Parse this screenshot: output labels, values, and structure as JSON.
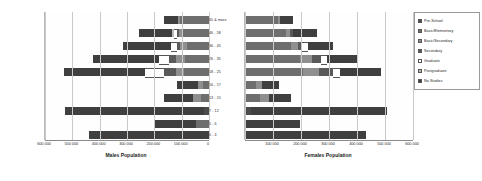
{
  "chart_data": {
    "type": "bar",
    "subtype": "population-pyramid-stacked",
    "title": "",
    "grid": true,
    "legend_position": "right",
    "categories": [
      "65 & more",
      "46 - 58",
      "36 - 45",
      "26 - 35",
      "18 - 25",
      "16 - 17",
      "13 - 15",
      "7 - 12",
      "5 - 6",
      "0 - 4"
    ],
    "series_names": [
      "Pre-School",
      "Basic/Elementary",
      "Basic/Secondary",
      "Secondary",
      "Graduate",
      "Postgraduate",
      "No Studies"
    ],
    "panels": [
      {
        "name": "males",
        "xlabel": "Males Population",
        "direction": "right-to-left",
        "xlim": [
          0,
          600000
        ],
        "ticks": [
          600000,
          500000,
          400000,
          300000,
          200000,
          100000,
          0
        ],
        "tick_labels": [
          "600 000",
          "500 000",
          "400 000",
          "300 000",
          "200 000",
          "100 000",
          "0"
        ],
        "stacks": [
          {
            "category": "65 & more",
            "values": [
              0,
              105000,
              8000,
              0,
              0,
              0,
              52000
            ],
            "total": 165000
          },
          {
            "category": "46 - 58",
            "values": [
              0,
              98000,
              12000,
              9000,
              10000,
              8000,
              118000
            ],
            "total": 255000
          },
          {
            "category": "36 - 45",
            "values": [
              0,
              82000,
              24000,
              12000,
              22000,
              0,
              175000
            ],
            "total": 315000
          },
          {
            "category": "26 - 35",
            "values": [
              0,
              88000,
              34000,
              26000,
              36000,
              0,
              240000
            ],
            "total": 424000
          },
          {
            "category": "18 - 25",
            "values": [
              0,
              92000,
              30000,
              42000,
              70000,
              0,
              296000
            ],
            "total": 530000
          },
          {
            "category": "16 - 17",
            "values": [
              0,
              22000,
              18000,
              0,
              0,
              0,
              78000
            ],
            "total": 118000
          },
          {
            "category": "13 - 15",
            "values": [
              0,
              28000,
              32000,
              0,
              0,
              0,
              104000
            ],
            "total": 164000
          },
          {
            "category": "7 - 12",
            "values": [
              18000,
              0,
              0,
              0,
              0,
              0,
              508000
            ],
            "total": 526000
          },
          {
            "category": "5 - 6",
            "values": [
              0,
              48000,
              0,
              0,
              0,
              0,
              150000
            ],
            "total": 198000
          },
          {
            "category": "0 - 4",
            "values": [
              0,
              0,
              0,
              0,
              0,
              0,
              440000
            ],
            "total": 440000
          }
        ]
      },
      {
        "name": "females",
        "xlabel": "Females Population",
        "direction": "left-to-right",
        "xlim": [
          0,
          600000
        ],
        "ticks": [
          0,
          100000,
          200000,
          300000,
          400000,
          500000,
          600000
        ],
        "tick_labels": [
          "",
          "100 000",
          "200 000",
          "300 000",
          "400 000",
          "500 000",
          "600 000"
        ],
        "stacks": [
          {
            "category": "65 & more",
            "values": [
              0,
              118000,
              8000,
              0,
              0,
              0,
              44000
            ],
            "total": 170000
          },
          {
            "category": "46 - 58",
            "values": [
              0,
              148000,
              14000,
              10000,
              0,
              0,
              86000
            ],
            "total": 258000
          },
          {
            "category": "36 - 45",
            "values": [
              0,
              166000,
              22000,
              16000,
              20000,
              0,
              90000
            ],
            "total": 314000
          },
          {
            "category": "26 - 35",
            "values": [
              0,
              196000,
              44000,
              30000,
              24000,
              0,
              110000
            ],
            "total": 404000
          },
          {
            "category": "18 - 25",
            "values": [
              0,
              206000,
              58000,
              50000,
              26000,
              0,
              146000
            ],
            "total": 486000
          },
          {
            "category": "16 - 17",
            "values": [
              0,
              38000,
              22000,
              0,
              0,
              0,
              62000
            ],
            "total": 122000
          },
          {
            "category": "13 - 15",
            "values": [
              0,
              52000,
              34000,
              0,
              0,
              0,
              78000
            ],
            "total": 164000
          },
          {
            "category": "7 - 12",
            "values": [
              22000,
              0,
              0,
              0,
              0,
              0,
              486000
            ],
            "total": 508000
          },
          {
            "category": "5 - 6",
            "values": [
              0,
              0,
              0,
              0,
              0,
              0,
              196000
            ],
            "total": 196000
          },
          {
            "category": "0 - 4",
            "values": [
              0,
              0,
              0,
              0,
              0,
              0,
              432000
            ],
            "total": 432000
          }
        ]
      }
    ],
    "colors": {
      "Pre-School": "#4b4b4b",
      "Basic/Elementary": "#6e6e6e",
      "Basic/Secondary": "#8f8f8f",
      "Secondary": "#ffffff",
      "Graduate": "#b9b9b9",
      "Postgraduate": "#5a5a5a",
      "No Studies": "#3f3f3f"
    }
  },
  "legend": {
    "items": [
      {
        "label": "Pre-School",
        "swatch": "c0"
      },
      {
        "label": "Basic/Elementary",
        "swatch": "c1"
      },
      {
        "label": "Basic/Secondary",
        "swatch": "c2"
      },
      {
        "label": "Secondary",
        "swatch": "c5"
      },
      {
        "label": "Graduate",
        "swatch": "c3"
      },
      {
        "label": "Postgraduate",
        "swatch": "c4"
      },
      {
        "label": "No Studies",
        "swatch": "c6"
      }
    ]
  }
}
